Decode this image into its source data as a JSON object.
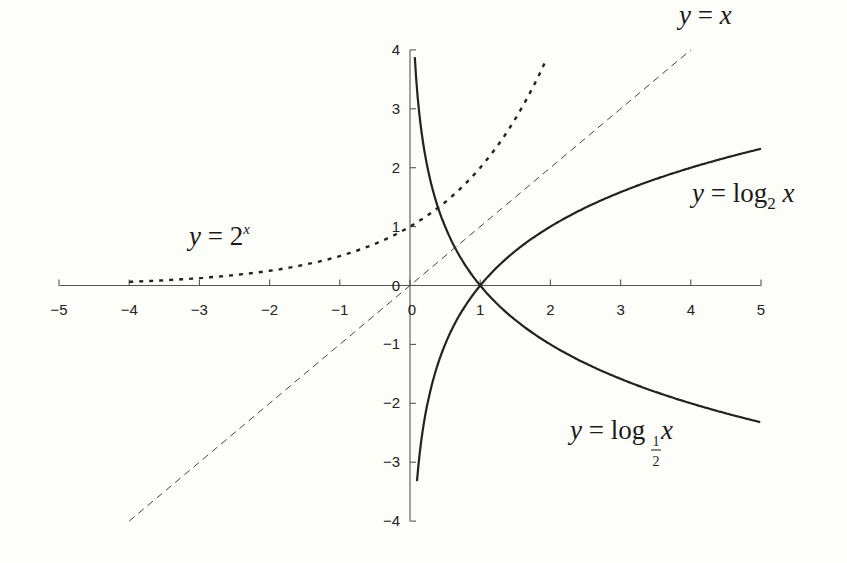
{
  "chart_data": {
    "type": "line",
    "title": "",
    "xlabel": "",
    "ylabel": "",
    "xlim": [
      -5,
      5
    ],
    "ylim": [
      -4,
      4
    ],
    "x_ticks": [
      -5,
      -4,
      -3,
      -2,
      -1,
      0,
      1,
      2,
      3,
      4,
      5
    ],
    "x_tick_labels": [
      "−5",
      "−4",
      "−3",
      "−2",
      "−1",
      "0",
      "1",
      "2",
      "3",
      "4",
      "5"
    ],
    "y_ticks": [
      -4,
      -3,
      -2,
      -1,
      0,
      1,
      2,
      3,
      4
    ],
    "y_tick_labels": [
      "−4",
      "−3",
      "−2",
      "−1",
      "0",
      "1",
      "2",
      "3",
      "4"
    ],
    "grid": false,
    "legend": "inline annotations",
    "series": [
      {
        "name": "y = 2^x",
        "style": "dotted",
        "x": [
          -4,
          -3.5,
          -3,
          -2.5,
          -2,
          -1.5,
          -1,
          -0.5,
          0,
          0.25,
          0.5,
          0.75,
          1,
          1.25,
          1.5,
          1.75,
          1.97
        ],
        "y": [
          0.0625,
          0.088,
          0.125,
          0.177,
          0.25,
          0.354,
          0.5,
          0.707,
          1,
          1.189,
          1.414,
          1.682,
          2,
          2.378,
          2.828,
          3.364,
          3.92
        ]
      },
      {
        "name": "y = x",
        "style": "dashed",
        "x": [
          -4,
          4
        ],
        "y": [
          -4,
          4
        ]
      },
      {
        "name": "y = log2 x",
        "style": "solid",
        "x": [
          0.1,
          0.15,
          0.2,
          0.3,
          0.4,
          0.5,
          0.7,
          1,
          1.5,
          2,
          2.5,
          3,
          3.5,
          4,
          4.5,
          5
        ],
        "y": [
          -3.32,
          -2.74,
          -2.32,
          -1.74,
          -1.32,
          -1,
          -0.51,
          0,
          0.58,
          1,
          1.32,
          1.58,
          1.81,
          2,
          2.17,
          2.32
        ]
      },
      {
        "name": "y = log1/2 x",
        "style": "solid",
        "x": [
          0.068,
          0.1,
          0.15,
          0.2,
          0.3,
          0.4,
          0.5,
          0.7,
          1,
          1.5,
          2,
          2.5,
          3,
          3.5,
          4,
          4.5,
          5
        ],
        "y": [
          3.88,
          3.32,
          2.74,
          2.32,
          1.74,
          1.32,
          1,
          0.51,
          0,
          -0.58,
          -1,
          -1.32,
          -1.58,
          -1.81,
          -2,
          -2.17,
          -2.32
        ]
      }
    ],
    "annotations": [
      {
        "text": "y = 2^x",
        "x": -3.1,
        "y": 0.9
      },
      {
        "text": "y = x",
        "x": 3.8,
        "y": 4.3
      },
      {
        "text": "y = log2 x",
        "x": 4.0,
        "y": 1.55
      },
      {
        "text": "y = log1/2 x",
        "x": 2.3,
        "y": -2.55
      }
    ]
  },
  "labels": {
    "exp": {
      "y": "y",
      "eq": " = ",
      "base": "2",
      "sup": "x"
    },
    "identity": {
      "y": "y",
      "eq": " = ",
      "x": "x"
    },
    "log2": {
      "y": "y",
      "eq": " = ",
      "log": "log",
      "sub": "2",
      "x": " x"
    },
    "loghalf": {
      "y": "y",
      "eq": " = ",
      "log": "log",
      "num": "1",
      "den": "2",
      "x": "x"
    }
  }
}
